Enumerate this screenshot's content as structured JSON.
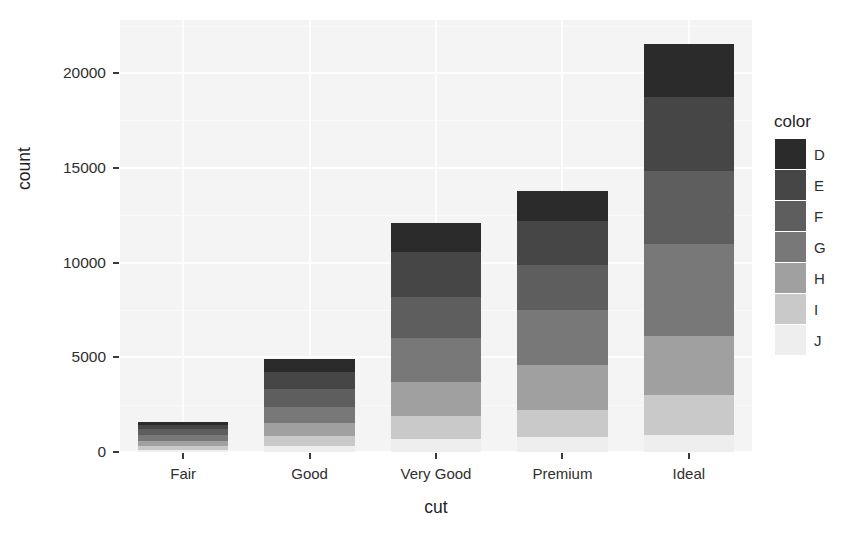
{
  "chart_data": {
    "type": "bar",
    "stacked": true,
    "title": "",
    "xlabel": "cut",
    "ylabel": "count",
    "categories": [
      "Fair",
      "Good",
      "Very Good",
      "Premium",
      "Ideal"
    ],
    "legend_title": "color",
    "legend_position": "right",
    "grid": true,
    "ylim": [
      0,
      22800
    ],
    "yticks": [
      0,
      5000,
      10000,
      15000,
      20000
    ],
    "ytick_labels": [
      "0",
      "5000",
      "10000",
      "15000",
      "20000"
    ],
    "series": [
      {
        "name": "D",
        "color": "#2b2b2b",
        "values": [
          163,
          662,
          1513,
          1603,
          2834
        ]
      },
      {
        "name": "E",
        "color": "#464646",
        "values": [
          224,
          933,
          2400,
          2337,
          3903
        ]
      },
      {
        "name": "F",
        "color": "#5e5e5e",
        "values": [
          312,
          909,
          2164,
          2331,
          3826
        ]
      },
      {
        "name": "G",
        "color": "#787878",
        "values": [
          314,
          871,
          2299,
          2924,
          4884
        ]
      },
      {
        "name": "H",
        "color": "#a0a0a0",
        "values": [
          303,
          702,
          1824,
          2360,
          3115
        ]
      },
      {
        "name": "I",
        "color": "#c9c9c9",
        "values": [
          175,
          522,
          1204,
          1428,
          2093
        ]
      },
      {
        "name": "J",
        "color": "#eeeeee",
        "values": [
          119,
          307,
          678,
          808,
          896
        ]
      }
    ],
    "totals": [
      1610,
      4906,
      12082,
      13791,
      21551
    ]
  },
  "panel": {
    "background": "#f4f4f4",
    "gridline_color": "#fdfdfd"
  }
}
